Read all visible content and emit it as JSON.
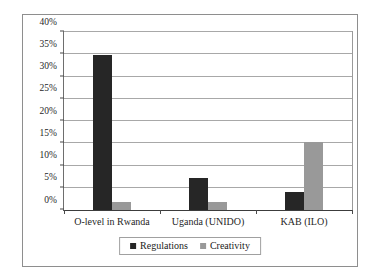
{
  "chart_data": {
    "type": "bar",
    "title": "",
    "subtitle": "",
    "xlabel": "",
    "ylabel": "",
    "categories": [
      "O-level in Rwanda",
      "Uganda (UNIDO)",
      "KAB (ILO)"
    ],
    "series": [
      {
        "name": "Regulations",
        "color": "#262626",
        "values": [
          34.8,
          7.3,
          4.0
        ]
      },
      {
        "name": "Creativity",
        "color": "#999999",
        "values": [
          1.8,
          1.7,
          15.3
        ]
      }
    ],
    "ylim": [
      0,
      40
    ],
    "ytick_values": [
      0,
      5,
      10,
      15,
      20,
      25,
      30,
      35,
      40
    ],
    "ytick_labels": [
      "0%",
      "5%",
      "10%",
      "15%",
      "20%",
      "25%",
      "30%",
      "35%",
      "40%"
    ],
    "value_suffix": "%",
    "grid": true,
    "grid_axis": "y",
    "legend_position": "bottom",
    "legend_entries": [
      "Regulations",
      "Creativity"
    ],
    "annotations": []
  },
  "style": {
    "background": "#ffffff",
    "frame_border": "#8e8e8e",
    "plot_border": "#6e6e6e",
    "gridline": "#a8a8a8",
    "axis": "#3c3c3c",
    "text": "#1f1f1f"
  }
}
